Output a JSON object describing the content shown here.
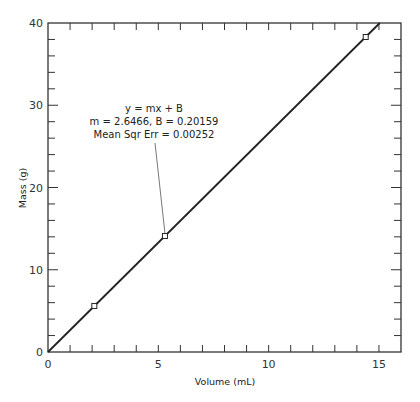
{
  "chart_data": {
    "type": "scatter",
    "title": "",
    "xlabel": "Volume (mL)",
    "ylabel": "Mass (g)",
    "xlim": [
      0,
      16
    ],
    "ylim": [
      0,
      40
    ],
    "xticks": [
      0,
      5,
      10,
      15
    ],
    "yticks": [
      0,
      10,
      20,
      30,
      40
    ],
    "x_minor_step": 1,
    "y_minor_step": 2,
    "grid": false,
    "series": [
      {
        "name": "data",
        "style": "open-square-markers",
        "points": [
          [
            2.1,
            5.6
          ],
          [
            5.3,
            14.1
          ],
          [
            14.4,
            38.3
          ]
        ]
      },
      {
        "name": "fit",
        "style": "line",
        "slope": 2.6466,
        "intercept": 0.20159
      }
    ],
    "annotation": {
      "lines": [
        "y = mx + B",
        "m = 2.6466, B = 0.20159",
        "Mean Sqr Err = 0.00252"
      ],
      "points_to": [
        5.3,
        14.1
      ]
    }
  },
  "axes": {
    "x_tick_labels": [
      "0",
      "5",
      "10",
      "15"
    ],
    "y_tick_labels": [
      "0",
      "10",
      "20",
      "30",
      "40"
    ]
  }
}
